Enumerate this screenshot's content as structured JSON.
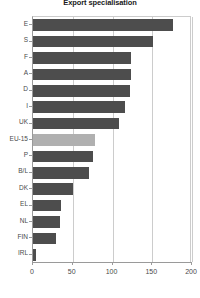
{
  "chart_data": {
    "type": "bar",
    "orientation": "horizontal",
    "title": "Export specialisation",
    "xlabel": "",
    "ylabel": "",
    "categories": [
      "E",
      "S",
      "F",
      "A",
      "D",
      "I",
      "UK",
      "EU-15",
      "P",
      "B/L",
      "DK",
      "EL",
      "NL",
      "FIN",
      "IRL"
    ],
    "values": [
      176,
      151,
      123,
      123,
      122,
      116,
      108,
      78,
      76,
      70,
      50,
      35,
      34,
      29,
      4
    ],
    "xlim": [
      0,
      200
    ],
    "xticks": [
      0,
      50,
      100,
      150,
      200
    ],
    "xtick_labels": [
      "0",
      "50",
      "100",
      "150",
      "200"
    ],
    "grid": true,
    "legend": false,
    "series": [
      {
        "name": "Export specialisation",
        "values": [
          176,
          151,
          123,
          123,
          122,
          116,
          108,
          78,
          76,
          70,
          50,
          35,
          34,
          29,
          4
        ]
      }
    ],
    "highlight_category": "EU-15",
    "colors": {
      "bar": "#4d4d4d",
      "bar_highlight": "#b0b0b0",
      "grid": "#cccccc",
      "axis": "#9a9a9a",
      "text": "#4a4a4a",
      "title": "#1a1a1a",
      "background": "#ffffff"
    }
  }
}
